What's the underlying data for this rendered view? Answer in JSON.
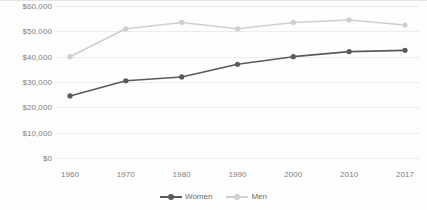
{
  "chart_data": {
    "type": "line",
    "title": "",
    "subtitle": "",
    "xlabel": "",
    "ylabel": "",
    "categories": [
      "1960",
      "1970",
      "1980",
      "1990",
      "2000",
      "2010",
      "2017"
    ],
    "series": [
      {
        "name": "Women",
        "color": "#5a5a5a",
        "values": [
          24500,
          30500,
          32000,
          37000,
          40000,
          42000,
          42500
        ]
      },
      {
        "name": "Men",
        "color": "#cfcfcf",
        "values": [
          40000,
          51000,
          53500,
          51000,
          53500,
          54500,
          52500
        ]
      }
    ],
    "ylim": [
      0,
      60000
    ],
    "ytick_values": [
      0,
      10000,
      20000,
      30000,
      40000,
      50000,
      60000
    ],
    "ytick_labels": [
      "$0",
      "$10,000",
      "$20,000",
      "$30,000",
      "$40,000",
      "$50,000",
      "$60,000"
    ],
    "xtick_labels": [
      "1960",
      "1970",
      "1980",
      "1990",
      "2000",
      "2010",
      "2017"
    ],
    "grid": true,
    "grid_axis": "y",
    "legend_position": "bottom",
    "legend_entries": [
      "Women",
      "Men"
    ],
    "marker": "circle",
    "background_color": "#fdfdfd",
    "grid_color": "#ececec",
    "tick_label_color": "#808080"
  }
}
